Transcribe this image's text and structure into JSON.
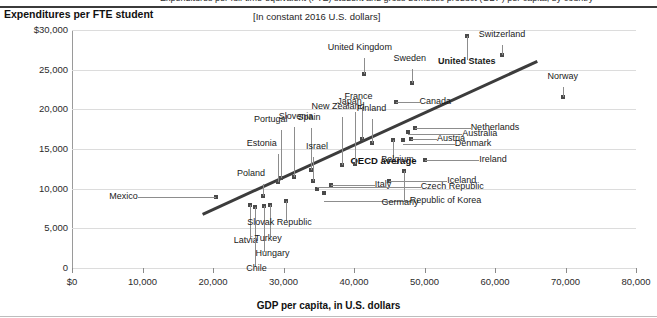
{
  "header": {
    "cut_title": "Expenditures per full-time-equivalent (FTE) student and gross domestic product (GDP) per capita, by country",
    "subtitle": "[In constant 2016 U.S. dollars]"
  },
  "chart_data": {
    "type": "scatter",
    "title": "Expenditures per FTE student",
    "subtitle": "[In constant 2016 U.S. dollars]",
    "xlabel": "GDP per capita, in U.S. dollars",
    "ylabel": "Expenditures per FTE student",
    "xlim": [
      0,
      80000
    ],
    "ylim": [
      0,
      30000
    ],
    "xticks": [
      0,
      10000,
      20000,
      30000,
      40000,
      50000,
      60000,
      70000,
      80000
    ],
    "xticklabels": [
      "$0",
      "10,000",
      "20,000",
      "30,000",
      "40,000",
      "50,000",
      "60,000",
      "70,000",
      "80,000"
    ],
    "yticks": [
      0,
      5000,
      10000,
      15000,
      20000,
      25000,
      30000
    ],
    "yticklabels": [
      "0",
      "5,000",
      "10,000",
      "15,000",
      "20,000",
      "25,000",
      "$30,000"
    ],
    "grid": true,
    "legend": "none",
    "trendline": {
      "label": "OECD average",
      "x": [
        18500,
        66000
      ],
      "y": [
        6900,
        26200
      ]
    },
    "points": [
      {
        "name": "Mexico",
        "x": 20400,
        "y": 8900,
        "label_pos": "left"
      },
      {
        "name": "Latvia",
        "x": 25200,
        "y": 8000,
        "label_pos": "below"
      },
      {
        "name": "Chile",
        "x": 25900,
        "y": 7700,
        "label_pos": "below"
      },
      {
        "name": "Hungary",
        "x": 27300,
        "y": 7800,
        "label_pos": "below"
      },
      {
        "name": "Poland",
        "x": 27100,
        "y": 9100,
        "label_pos": "above"
      },
      {
        "name": "Turkey",
        "x": 28100,
        "y": 7900,
        "label_pos": "below"
      },
      {
        "name": "Slovak Republic",
        "x": 30300,
        "y": 8400,
        "label_pos": "below"
      },
      {
        "name": "Estonia",
        "x": 29200,
        "y": 10900,
        "label_pos": "above"
      },
      {
        "name": "Portugal",
        "x": 29600,
        "y": 11400,
        "label_pos": "above"
      },
      {
        "name": "Slovenia",
        "x": 31500,
        "y": 11500,
        "label_pos": "above"
      },
      {
        "name": "Spain",
        "x": 33900,
        "y": 12300,
        "label_pos": "above"
      },
      {
        "name": "Israel",
        "x": 34200,
        "y": 11000,
        "label_pos": "above"
      },
      {
        "name": "Republic of Korea",
        "x": 35700,
        "y": 9500,
        "label_pos": "right"
      },
      {
        "name": "Italy",
        "x": 36700,
        "y": 10400,
        "label_pos": "right"
      },
      {
        "name": "Czech Republic",
        "x": 34700,
        "y": 9900,
        "label_pos": "right"
      },
      {
        "name": "New Zealand",
        "x": 38300,
        "y": 13000,
        "label_pos": "above"
      },
      {
        "name": "Japan",
        "x": 40200,
        "y": 13100,
        "label_pos": "above"
      },
      {
        "name": "France",
        "x": 41200,
        "y": 16200,
        "label_pos": "above"
      },
      {
        "name": "Finland",
        "x": 42500,
        "y": 15700,
        "label_pos": "above"
      },
      {
        "name": "United Kingdom",
        "x": 41400,
        "y": 24500,
        "label_pos": "above"
      },
      {
        "name": "Canada",
        "x": 45900,
        "y": 20900,
        "label_pos": "right"
      },
      {
        "name": "Sweden",
        "x": 48200,
        "y": 23300,
        "label_pos": "above"
      },
      {
        "name": "United States",
        "x": 56000,
        "y": 29300,
        "label_pos": "below"
      },
      {
        "name": "Switzerland",
        "x": 61000,
        "y": 26800,
        "label_pos": "above"
      },
      {
        "name": "Norway",
        "x": 69600,
        "y": 21600,
        "label_pos": "above"
      },
      {
        "name": "Belgium",
        "x": 45600,
        "y": 16100,
        "label_pos": "below"
      },
      {
        "name": "Netherlands",
        "x": 48600,
        "y": 17600,
        "label_pos": "right"
      },
      {
        "name": "Australia",
        "x": 47700,
        "y": 17100,
        "label_pos": "right"
      },
      {
        "name": "Austria",
        "x": 48100,
        "y": 16300,
        "label_pos": "right"
      },
      {
        "name": "Denmark",
        "x": 46900,
        "y": 16100,
        "label_pos": "right"
      },
      {
        "name": "Ireland",
        "x": 50100,
        "y": 13600,
        "label_pos": "right"
      },
      {
        "name": "Germany",
        "x": 47100,
        "y": 12200,
        "label_pos": "above"
      },
      {
        "name": "Iceland",
        "x": 45000,
        "y": 11000,
        "label_pos": "right"
      }
    ]
  }
}
